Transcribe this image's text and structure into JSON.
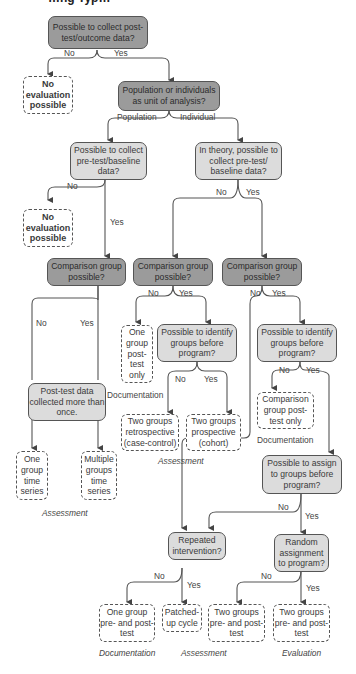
{
  "title": "…ng Typ…",
  "nodes": {
    "q_posttest": "Possible to collect post-test/outcome data?",
    "no_eval_1": "No evaluation possible",
    "q_unit": "Population or individuals as unit of analysis?",
    "q_pre_pop": "Possible to collect pre-test/baseline data?",
    "q_pre_ind": "In theory, possible to collect pre-test/ baseline data?",
    "no_eval_2": "No evaluation possible",
    "q_comp_1": "Comparison group possible?",
    "q_comp_2": "Comparison group possible?",
    "q_comp_3": "Comparison group possible?",
    "q_posttest_multi": "Post-test data collected more than once.",
    "one_group_post": "One group post- test only",
    "q_identify_1": "Possible to identify groups before program?",
    "q_identify_2": "Possible to identify groups before program?",
    "two_retro": "Two groups retrospective (case-control)",
    "two_prosp": "Two groups prospective (cohort)",
    "comp_post_only": "Comparison group post- test only",
    "one_ts": "One group time series",
    "multi_ts": "Multiple groups time series",
    "q_assign": "Possible to assign to groups before program?",
    "q_repeated": "Repeated intervention?",
    "q_random": "Random assignment to program?",
    "one_prepost": "One group pre- and post-test",
    "patched": "Patched- up cycle",
    "two_prepost_1": "Two groups pre- and post-test",
    "two_prepost_2": "Two groups pre- and post-test"
  },
  "edge_labels": {
    "no": "No",
    "yes": "Yes",
    "population": "Population",
    "individual": "Individual"
  },
  "categories": {
    "documentation": "Documentation",
    "assessment": "Assessment",
    "evaluation": "Evaluation"
  }
}
